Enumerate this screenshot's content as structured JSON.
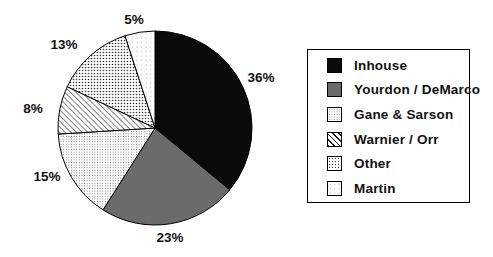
{
  "figure": {
    "background": "#ffffff"
  },
  "chart_data": {
    "type": "pie",
    "title": "",
    "categories": [
      "Inhouse",
      "Yourdon / DeMarco",
      "Gane & Sarson",
      "Warnier / Orr",
      "Other",
      "Martin"
    ],
    "values": [
      36,
      23,
      15,
      8,
      13,
      5
    ],
    "slice_labels": [
      "36%",
      "23%",
      "15%",
      "8%",
      "13%",
      "5%"
    ],
    "unit": "percent",
    "start_angle_deg": 0,
    "direction": "clockwise",
    "legend_position": "right",
    "legend_border": true,
    "slice_styles": [
      "solid-black",
      "solid-gray",
      "dots-fine",
      "hatch-diagonal",
      "dots-medium",
      "dots-sparse"
    ],
    "colors": {
      "solid_black": "#0a0a0a",
      "solid_gray": "#6b6b6b",
      "pattern_ink": "#1a1a1a",
      "background": "#ffffff",
      "outline": "#000000"
    },
    "label_positions_px": [
      [
        261,
        77
      ],
      [
        170,
        237
      ],
      [
        47,
        176
      ],
      [
        33,
        108
      ],
      [
        64,
        44
      ],
      [
        134,
        19
      ]
    ]
  }
}
